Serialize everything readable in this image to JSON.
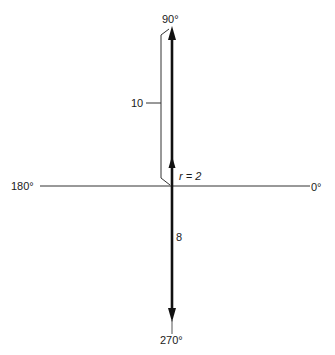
{
  "diagram": {
    "axis_labels": {
      "top": "90°",
      "bottom": "270°",
      "left": "180°",
      "right": "0°"
    },
    "vectors": [
      {
        "name": "upward-long-vector",
        "direction_deg": 90,
        "magnitude_label": "10"
      },
      {
        "name": "radius-vector",
        "direction_deg": 90,
        "magnitude_label": "r = 2"
      },
      {
        "name": "downward-vector",
        "direction_deg": 270,
        "magnitude_label": "8"
      }
    ],
    "labels": {
      "bracket_value": "10",
      "radius": "r = 2",
      "down_value": "8"
    },
    "colors": {
      "line": "#1a1a1a",
      "axis": "#333333",
      "background": "#ffffff"
    }
  }
}
